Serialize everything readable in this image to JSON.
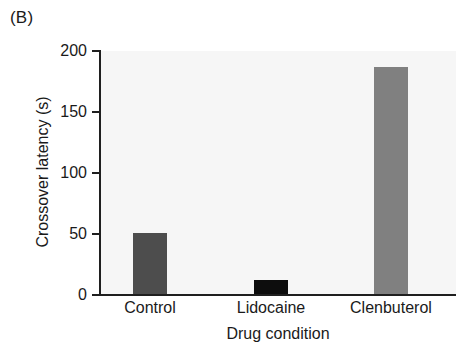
{
  "figure": {
    "panel_label": "(B)"
  },
  "chart_data": {
    "type": "bar",
    "title": "",
    "subtitle": "",
    "xlabel": "Drug condition",
    "ylabel": "Crossover latency (s)",
    "categories": [
      "Control",
      "Lidocaine",
      "Clenbuterol"
    ],
    "values": [
      51,
      12,
      187
    ],
    "series": [
      {
        "name": "Crossover latency",
        "values": [
          51,
          12,
          187
        ]
      }
    ],
    "bar_colors": [
      "#4d4d4d",
      "#0d0d0d",
      "#808080"
    ],
    "ylim": [
      0,
      200
    ],
    "yticks": [
      0,
      50,
      100,
      150,
      200
    ],
    "ytick_labels": [
      "0",
      "50",
      "100",
      "150",
      "200"
    ],
    "xlim_categories": 3,
    "grid": false,
    "legend": "none",
    "plot_background": "#f6f6f6",
    "axis_color": "#1f1f1f",
    "text_color": "#1a1a1a",
    "annotations": []
  }
}
